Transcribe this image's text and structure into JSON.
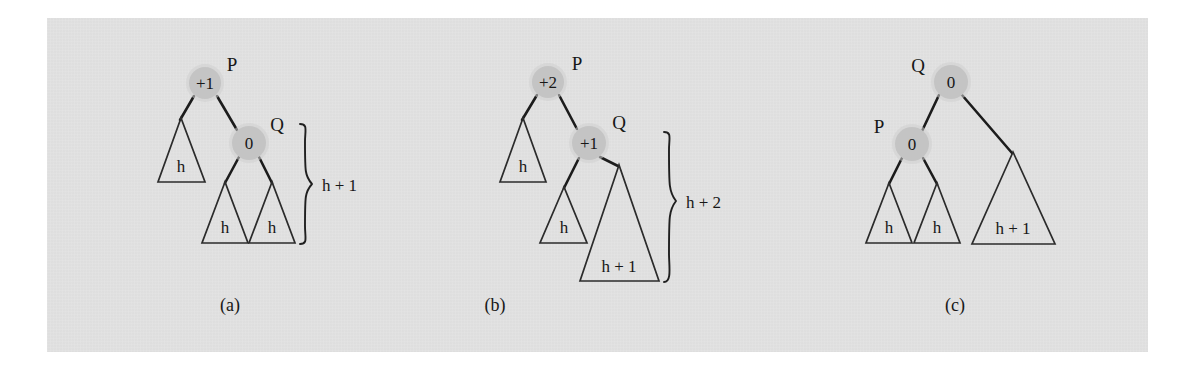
{
  "figure": {
    "caption_a": "(a)",
    "caption_b": "(b)",
    "caption_c": "(c)",
    "background_color": "#e3e3e3",
    "page_color": "#ffffff",
    "node_fill_color": "#c4c4c4",
    "ink_color": "#1c1c1c"
  },
  "panel_a": {
    "caption": "(a)",
    "node_p_value": "+1",
    "node_p_name": "P",
    "node_q_value": "0",
    "node_q_name": "Q",
    "subtree_left": "h",
    "subtree_q_left": "h",
    "subtree_q_right": "h",
    "brace_label": "h + 1"
  },
  "panel_b": {
    "caption": "(b)",
    "node_p_value": "+2",
    "node_p_name": "P",
    "node_q_value": "+1",
    "node_q_name": "Q",
    "subtree_left": "h",
    "subtree_q_left": "h",
    "subtree_q_right": "h + 1",
    "brace_label": "h + 2"
  },
  "panel_c": {
    "caption": "(c)",
    "node_q_value": "0",
    "node_q_name": "Q",
    "node_p_value": "0",
    "node_p_name": "P",
    "subtree_p_left": "h",
    "subtree_p_right": "h",
    "subtree_q_right": "h + 1"
  }
}
